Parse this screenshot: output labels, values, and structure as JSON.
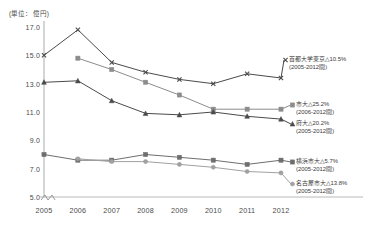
{
  "unit_label": "(単位：億円)",
  "chart_data": {
    "type": "line",
    "title": "",
    "subtitle": "",
    "xlabel": "",
    "ylabel": "(単位：億円)",
    "unit": "億円",
    "grid": false,
    "legend_position": "right-inline",
    "axis_break": true,
    "ylim": [
      5.0,
      17.0
    ],
    "yticks": [
      "17.0",
      "15.0",
      "13.0",
      "11.0",
      "9.0",
      "7.0",
      "5.0"
    ],
    "ytick_values": [
      17.0,
      15.0,
      13.0,
      11.0,
      9.0,
      7.0,
      5.0
    ],
    "categories": [
      "2005",
      "2006",
      "2007",
      "2008",
      "2009",
      "2010",
      "2011",
      "2012"
    ],
    "x": [
      2005,
      2006,
      2007,
      2008,
      2009,
      2010,
      2011,
      2012
    ],
    "series": [
      {
        "name": "首都大学東京",
        "change": "△10.5%",
        "period": "(2005-2012間)",
        "label_line1": "首都大学東京△10.5%",
        "label_line2": "(2005-2012間)",
        "marker": "cross",
        "color": "#4a4a4a",
        "values": [
          15.0,
          16.8,
          14.5,
          13.8,
          13.3,
          13.0,
          13.7,
          13.4
        ]
      },
      {
        "name": "市大",
        "change": "△25.2%",
        "period": "(2006-2012間)",
        "label_line1": "市大△25.2%",
        "label_line2": "(2006-2012間)",
        "marker": "square",
        "color": "#8c8c8c",
        "values": [
          null,
          14.8,
          14.0,
          13.1,
          12.2,
          11.2,
          11.2,
          11.2
        ]
      },
      {
        "name": "府大",
        "change": "△20.2%",
        "period": "(2005-2012間)",
        "label_line1": "府大△20.2%",
        "label_line2": "(2005-2012間)",
        "marker": "triangle",
        "color": "#4a4a4a",
        "values": [
          13.1,
          13.2,
          11.8,
          10.9,
          10.8,
          11.0,
          10.7,
          10.5
        ]
      },
      {
        "name": "横浜市大",
        "change": "△5.7%",
        "period": "(2005-2012間)",
        "label_line1": "横浜市大△5.7%",
        "label_line2": "(2005-2012間)",
        "marker": "square",
        "color": "#6e6e6e",
        "values": [
          8.0,
          7.6,
          7.6,
          8.0,
          7.8,
          7.6,
          7.3,
          7.6
        ]
      },
      {
        "name": "名古屋市大",
        "change": "△13.8%",
        "period": "(2005-2012間)",
        "label_line1": "名古屋市大△13.8%",
        "label_line2": "(2005-2012間)",
        "marker": "circle",
        "color": "#a0a0a0",
        "values": [
          null,
          7.7,
          7.5,
          7.5,
          7.3,
          7.1,
          6.8,
          6.7
        ]
      }
    ]
  }
}
